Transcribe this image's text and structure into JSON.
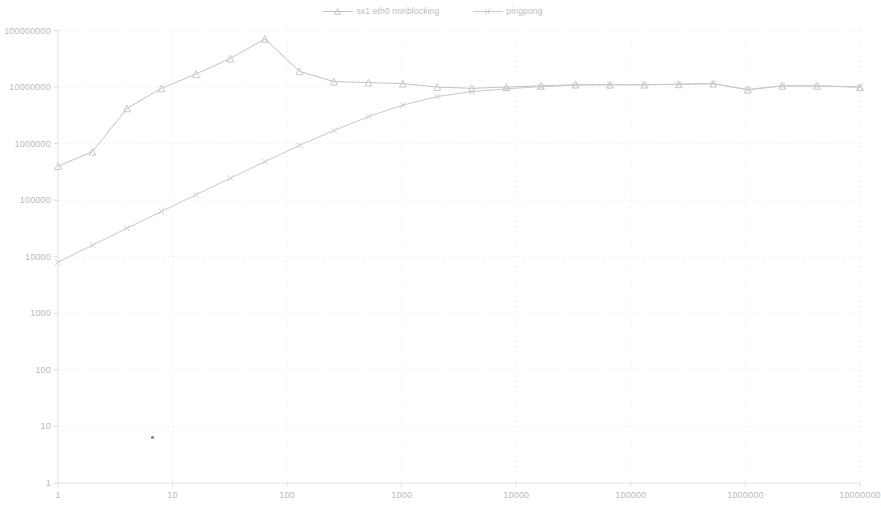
{
  "chart": {
    "type": "line",
    "title": "",
    "background_color": "#ffffff",
    "legend_position": "top-center",
    "grid": true,
    "grid_color": "#f1f1f3",
    "line_color": "#c9c9cd",
    "marker_color": "#c2c2c8",
    "text_color": "#b9b9bf"
  },
  "legend": {
    "entries": [
      {
        "label": "sx1 eth0 nonblocking",
        "marker": "triangle",
        "color": "#c2c2c8"
      },
      {
        "label": "pingpong",
        "marker": "cross",
        "color": "#c9c9cd"
      }
    ]
  },
  "axes": {
    "x": {
      "scale": "log",
      "min": 1,
      "max": 10000000,
      "ticks": [
        "1",
        "10",
        "100",
        "1000",
        "10000",
        "100000",
        "1000000",
        "10000000"
      ],
      "tick_values": [
        1,
        10,
        100,
        1000,
        10000,
        100000,
        1000000,
        10000000
      ],
      "label": ""
    },
    "y": {
      "scale": "log",
      "min": 1,
      "max": 100000000,
      "ticks": [
        "100000000",
        "10000000",
        "1000000",
        "100000",
        "10000",
        "1000",
        "100",
        "10",
        "1"
      ],
      "tick_values": [
        100000000,
        10000000,
        1000000,
        100000,
        10000,
        1000,
        100,
        10,
        1
      ],
      "label": ""
    }
  },
  "chart_data": {
    "type": "line",
    "title": "",
    "xlabel": "",
    "ylabel": "",
    "xscale": "log",
    "yscale": "log",
    "xlim": [
      1,
      10000000
    ],
    "ylim": [
      1,
      100000000
    ],
    "grid": true,
    "legend_position": "top-center",
    "series": [
      {
        "name": "sx1 eth0 nonblocking",
        "marker": "triangle",
        "color": "#c2c2c8",
        "points": [
          [
            1,
            400000
          ],
          [
            2,
            720000
          ],
          [
            4,
            4200000
          ],
          [
            8,
            9500000
          ],
          [
            16,
            17000000
          ],
          [
            32,
            32000000
          ],
          [
            64,
            71000000
          ],
          [
            128,
            19000000
          ],
          [
            256,
            12500000
          ],
          [
            512,
            12000000
          ],
          [
            1024,
            11500000
          ],
          [
            2048,
            10000000
          ],
          [
            4096,
            9500000
          ],
          [
            8192,
            10000000
          ],
          [
            16384,
            10500000
          ],
          [
            32768,
            11000000
          ],
          [
            65536,
            11000000
          ],
          [
            131072,
            11000000
          ],
          [
            262144,
            11200000
          ],
          [
            524288,
            11500000
          ],
          [
            1048576,
            9000000
          ],
          [
            2097152,
            10500000
          ],
          [
            4194304,
            10500000
          ],
          [
            10000000,
            10000000
          ]
        ]
      },
      {
        "name": "pingpong",
        "marker": "cross",
        "color": "#c9c9cd",
        "points": [
          [
            1,
            8000
          ],
          [
            2,
            16000
          ],
          [
            4,
            32000
          ],
          [
            8,
            63000
          ],
          [
            16,
            125000
          ],
          [
            32,
            245000
          ],
          [
            64,
            480000
          ],
          [
            128,
            930000
          ],
          [
            256,
            1700000
          ],
          [
            512,
            3000000
          ],
          [
            1024,
            4800000
          ],
          [
            2048,
            6800000
          ],
          [
            4096,
            8300000
          ],
          [
            8192,
            9300000
          ],
          [
            16384,
            10200000
          ],
          [
            32768,
            10800000
          ],
          [
            65536,
            11000000
          ],
          [
            131072,
            11000000
          ],
          [
            262144,
            11200000
          ],
          [
            524288,
            11500000
          ],
          [
            1048576,
            9000000
          ],
          [
            2097152,
            10500000
          ],
          [
            4194304,
            10500000
          ],
          [
            10000000,
            10000000
          ]
        ]
      }
    ]
  }
}
